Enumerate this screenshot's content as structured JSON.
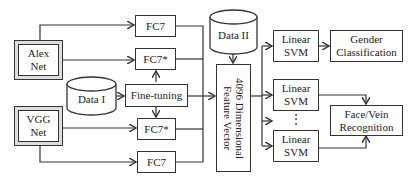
{
  "nodes": {
    "alexnet": "Alex Net",
    "vggnet": "VGG Net",
    "fc7_top": "FC7",
    "fc7star_top": "FC7*",
    "data1": "Data I",
    "finetune": "Fine-tuning",
    "fc7star_bottom": "FC7*",
    "fc7_bottom": "FC7",
    "data2": "Data II",
    "feature": "4096 Dimensional Feature Vector",
    "svm1": "Linear SVM",
    "svm2": "Linear SVM",
    "svm3": "Linear SVM",
    "gender": "Gender Classification",
    "facevein": "Face/Vein Recognition",
    "ellipsis": "⋮"
  }
}
